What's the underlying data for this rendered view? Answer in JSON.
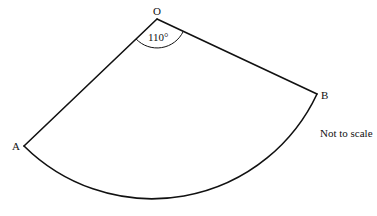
{
  "diagram": {
    "type": "sector",
    "points": {
      "O": {
        "label": "O",
        "x": 157,
        "y": 19
      },
      "A": {
        "label": "A",
        "x": 24,
        "y": 146
      },
      "B": {
        "label": "B",
        "x": 317,
        "y": 94
      }
    },
    "angle": {
      "vertex": "O",
      "value": 110,
      "label": "110°"
    },
    "note": "Not to scale",
    "colors": {
      "stroke": "#111111",
      "background": "#ffffff"
    }
  }
}
